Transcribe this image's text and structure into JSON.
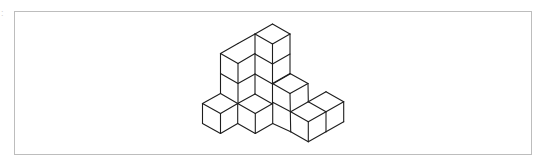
{
  "figure": {
    "corner_mark": ":",
    "frame": {
      "x": 14,
      "y": 11,
      "width": 517,
      "height": 143,
      "stroke": "#bdbdbd"
    },
    "stroke_color": "#1e1e1e",
    "stroke_width": 1.1,
    "segments": [
      [
        272.5,
        24,
        290,
        34
      ],
      [
        272.5,
        24,
        255,
        34
      ],
      [
        255,
        34,
        272.5,
        44
      ],
      [
        272.5,
        44,
        290,
        34
      ],
      [
        255,
        34,
        255,
        94
      ],
      [
        272.5,
        44,
        272.5,
        104
      ],
      [
        290,
        34,
        290,
        74
      ],
      [
        255,
        54,
        272.5,
        64
      ],
      [
        272.5,
        64,
        290,
        54
      ],
      [
        255,
        74,
        272.5,
        84
      ],
      [
        272.5,
        84,
        290,
        74
      ],
      [
        238,
        43.5,
        255,
        34
      ],
      [
        238,
        43.5,
        220.5,
        53.5
      ],
      [
        220.5,
        53.5,
        238,
        63.5
      ],
      [
        238,
        63.5,
        255,
        53.5
      ],
      [
        220.5,
        53.5,
        220.5,
        93.5
      ],
      [
        238,
        63.5,
        238,
        103.5
      ],
      [
        220.5,
        73.5,
        238,
        83.5
      ],
      [
        238,
        83.5,
        255,
        74
      ],
      [
        255,
        94,
        237.7,
        103.5
      ],
      [
        255,
        94,
        272.5,
        104
      ],
      [
        220.5,
        93.5,
        202.5,
        103.5
      ],
      [
        220.5,
        93.5,
        237.7,
        103.5
      ],
      [
        202.5,
        103.5,
        220.5,
        113.5
      ],
      [
        220.5,
        113.5,
        237.7,
        103.5
      ],
      [
        202.5,
        103.5,
        202.5,
        123.5
      ],
      [
        220.5,
        113.5,
        220.5,
        133.5
      ],
      [
        237.7,
        103.5,
        237.7,
        123.5
      ],
      [
        202.5,
        123.5,
        220.5,
        133.5
      ],
      [
        220.5,
        133.5,
        237.7,
        123.5
      ],
      [
        237.7,
        103.5,
        255.3,
        113.5
      ],
      [
        255.3,
        113.5,
        272.7,
        103.5
      ],
      [
        255.3,
        113.5,
        255.3,
        133.5
      ],
      [
        272.7,
        103.5,
        272.7,
        123.5
      ],
      [
        237.7,
        123.5,
        255.3,
        133.5
      ],
      [
        255.3,
        133.5,
        272.7,
        123.5
      ],
      [
        290,
        73.5,
        272.5,
        83.5
      ],
      [
        290,
        73.5,
        308,
        83.5
      ],
      [
        272.5,
        83.5,
        290,
        93.5
      ],
      [
        290,
        93.5,
        308,
        83.5
      ],
      [
        290,
        93.5,
        290.7,
        131.7
      ],
      [
        308,
        83.5,
        308.3,
        101.7
      ],
      [
        272.7,
        102.3,
        290.7,
        111.7
      ],
      [
        272.7,
        123.5,
        290.7,
        131.7
      ],
      [
        308.3,
        101.7,
        290.7,
        111.7
      ],
      [
        308.3,
        101.7,
        326,
        111.7
      ],
      [
        290.7,
        111.7,
        308.3,
        121.7
      ],
      [
        308.3,
        121.7,
        326,
        111.7
      ],
      [
        308.3,
        121.7,
        308.3,
        141.7
      ],
      [
        326,
        111.7,
        326,
        131.7
      ],
      [
        290.7,
        131.7,
        308.3,
        141.7
      ],
      [
        308.3,
        141.7,
        326,
        131.7
      ],
      [
        326,
        91.7,
        308.3,
        101.7
      ],
      [
        326,
        91.7,
        343.7,
        101.7
      ],
      [
        326,
        111.7,
        343.7,
        101.7
      ],
      [
        343.7,
        101.7,
        343.7,
        121.7
      ],
      [
        326,
        131.7,
        343.7,
        121.7
      ]
    ]
  }
}
